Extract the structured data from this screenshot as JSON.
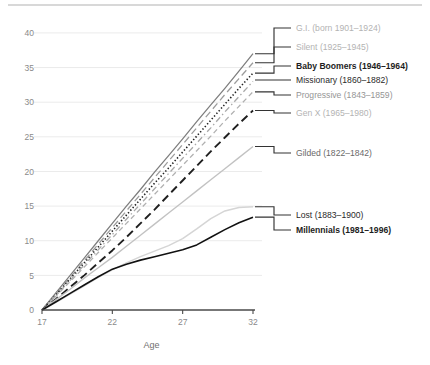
{
  "chart_data": {
    "type": "line",
    "title": "",
    "xlabel": "Age",
    "ylabel": "",
    "xlim": [
      17,
      32
    ],
    "ylim": [
      0,
      41
    ],
    "xticks": [
      "17",
      "22",
      "27",
      "32"
    ],
    "xtick_values": [
      17,
      22,
      27,
      32
    ],
    "yticks": [
      "0",
      "5",
      "10",
      "15",
      "20",
      "25",
      "30",
      "35",
      "40"
    ],
    "ytick_values": [
      0,
      5,
      10,
      15,
      20,
      25,
      30,
      35,
      40
    ],
    "grid": true,
    "legend_position": "right-inline-labels",
    "x": [
      17,
      18,
      19,
      20,
      21,
      22,
      23,
      24,
      25,
      26,
      27,
      28,
      29,
      30,
      31,
      32
    ],
    "series": [
      {
        "name": "G.I. (born 1901–1924)",
        "label": "G.I. (born 1901–1924)",
        "style": "solid",
        "color": "#7d7d7d",
        "label_color": "#b3b3b3",
        "label_weight": "normal",
        "end_value": 37.0,
        "values": [
          0,
          2.5,
          5.0,
          7.5,
          10.0,
          12.5,
          15.0,
          17.4,
          19.9,
          22.3,
          24.7,
          27.2,
          29.6,
          32.0,
          34.5,
          37.0
        ]
      },
      {
        "name": "Silent (1925–1945)",
        "label": "Silent (1925–1945)",
        "style": "long-dash",
        "color": "#9b9b9b",
        "label_color": "#bdbdbd",
        "label_weight": "normal",
        "end_value": 35.7,
        "values": [
          0,
          2.3,
          4.7,
          7.1,
          9.5,
          11.9,
          14.3,
          16.7,
          19.1,
          21.5,
          23.9,
          26.3,
          28.7,
          31.1,
          33.4,
          35.7
        ]
      },
      {
        "name": "Baby Boomers (1946–1964)",
        "label": "Baby Boomers (1946–1964)",
        "style": "dotted",
        "color": "#222222",
        "label_color": "#1d1d1d",
        "label_weight": "bold",
        "end_value": 34.2,
        "values": [
          0,
          2.2,
          4.5,
          6.8,
          9.1,
          11.4,
          13.7,
          16.0,
          18.3,
          20.5,
          22.8,
          25.1,
          27.4,
          29.7,
          32.0,
          34.2
        ]
      },
      {
        "name": "Missionary (1860–1882)",
        "label": "Missionary (1860–1882)",
        "style": "dash-dot",
        "color": "#a8a8a8",
        "label_color": "#2a2a2a",
        "label_weight": "normal",
        "end_value": 33.0,
        "values": [
          0,
          2.1,
          4.3,
          6.5,
          8.7,
          10.9,
          13.1,
          15.3,
          17.5,
          19.7,
          21.9,
          24.1,
          26.3,
          28.6,
          30.8,
          33.0
        ]
      },
      {
        "name": "Progressive (1843–1859)",
        "label": "Progressive (1843–1859)",
        "style": "medium-dash",
        "color": "#b0b0b0",
        "label_color": "#9a9a9a",
        "label_weight": "normal",
        "end_value": 31.5,
        "values": [
          0,
          2.0,
          4.1,
          6.2,
          8.3,
          10.4,
          12.5,
          14.6,
          16.7,
          18.8,
          20.9,
          23.0,
          25.1,
          27.3,
          29.4,
          31.5
        ]
      },
      {
        "name": "Gen X (1965–1980)",
        "label": "Gen X (1965–1980)",
        "style": "long-dash-dark",
        "color": "#1f1f1f",
        "label_color": "#b0b0b0",
        "label_weight": "normal",
        "end_value": 28.8,
        "values": [
          0,
          1.6,
          3.3,
          5.0,
          6.8,
          8.6,
          10.5,
          12.5,
          14.5,
          16.6,
          18.7,
          20.8,
          22.9,
          24.9,
          26.9,
          28.8
        ]
      },
      {
        "name": "Gilded (1822–1842)",
        "label": "Gilded (1822–1842)",
        "style": "solid-light",
        "color": "#c2c2c2",
        "label_color": "#4a4a4a",
        "label_weight": "normal",
        "end_value": 23.6,
        "values": [
          0,
          1.5,
          3.0,
          4.6,
          6.1,
          7.6,
          9.2,
          10.8,
          12.4,
          14.0,
          15.6,
          17.2,
          18.8,
          20.4,
          22.0,
          23.6
        ]
      },
      {
        "name": "Lost (1883–1900)",
        "label": "Lost (1883–1900)",
        "style": "solid-pale",
        "color": "#d5d5d5",
        "label_color": "#3a3a3a",
        "label_weight": "normal",
        "end_value": 14.9,
        "values": [
          0,
          1.1,
          2.3,
          3.5,
          4.7,
          5.8,
          6.8,
          7.7,
          8.5,
          9.3,
          10.3,
          11.7,
          13.2,
          14.3,
          14.8,
          14.9
        ]
      },
      {
        "name": "Millennials (1981–1996)",
        "label": "Millennials (1981–1996)",
        "style": "solid-dark",
        "color": "#111111",
        "label_color": "#111111",
        "label_weight": "bold",
        "end_value": 13.4,
        "values": [
          0,
          1.2,
          2.4,
          3.6,
          4.8,
          5.9,
          6.6,
          7.2,
          7.7,
          8.2,
          8.7,
          9.4,
          10.5,
          11.6,
          12.6,
          13.4
        ]
      }
    ]
  },
  "axes": {
    "x_title": "Age",
    "x_tick_labels": [
      "17",
      "22",
      "27",
      "32"
    ],
    "y_tick_labels": [
      "0",
      "5",
      "10",
      "15",
      "20",
      "25",
      "30",
      "35",
      "40"
    ]
  },
  "legend": {
    "entries": [
      {
        "label": "G.I. (born 1901–1924)",
        "tone": "lg-light"
      },
      {
        "label": "Silent (1925–1945)",
        "tone": "lg-light"
      },
      {
        "label": "Baby Boomers (1946–1964)",
        "tone": "lg-dark"
      },
      {
        "label": "Missionary (1860–1882)",
        "tone": "lg-mid"
      },
      {
        "label": "Progressive (1843–1859)",
        "tone": "lg-gray"
      },
      {
        "label": "Gen X (1965–1980)",
        "tone": "lg-light"
      },
      {
        "label": "Gilded (1822–1842)",
        "tone": "lg-semi"
      },
      {
        "label": "Lost (1883–1900)",
        "tone": "lg-mid"
      },
      {
        "label": "Millennials (1981–1996)",
        "tone": "lg-dark"
      }
    ]
  },
  "colors": {
    "grid": "#ebebeb",
    "axis": "#4a4a4a",
    "tick_text": "#8a8a8a",
    "top_rule": "#d8d8d8"
  }
}
